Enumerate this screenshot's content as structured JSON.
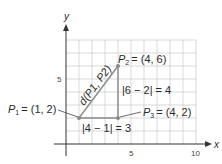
{
  "diagram": {
    "type": "coordinate-plane",
    "colors": {
      "grid": "#c8c8c8",
      "axis": "#333333",
      "segment": "#8a8a8a",
      "point": "#8a8a8a",
      "text": "#2b2b2b"
    },
    "axes": {
      "x_label": "x",
      "y_label": "y",
      "x_ticks": [
        {
          "value": 5,
          "label": "5"
        },
        {
          "value": 10,
          "label": "10"
        }
      ],
      "y_ticks": [
        {
          "value": 5,
          "label": "5"
        }
      ],
      "x_range": [
        0,
        10
      ],
      "y_range": [
        0,
        8
      ]
    },
    "points": [
      {
        "id": "P1",
        "name": "P",
        "sub": "1",
        "x": 1,
        "y": 2,
        "label": "P1 = (1, 2)",
        "coords": "= (1, 2)"
      },
      {
        "id": "P2",
        "name": "P",
        "sub": "2",
        "x": 4,
        "y": 6,
        "label": "P2 = (4, 6)",
        "coords": "= (4, 6)"
      },
      {
        "id": "P3",
        "name": "P",
        "sub": "3",
        "x": 4,
        "y": 2,
        "label": "P3 = (4, 2)",
        "coords": "= (4, 2)"
      }
    ],
    "segments": [
      {
        "from": "P1",
        "to": "P2",
        "label": "d(P1, P2)"
      },
      {
        "from": "P1",
        "to": "P3",
        "label": "|4 − 1| = 3"
      },
      {
        "from": "P3",
        "to": "P2",
        "label": "|6 − 2| = 4"
      }
    ],
    "annotations": {
      "distance": "d(P1, P2)",
      "horizontal": "|4 − 1| = 3",
      "vertical": "|6 − 2| = 4"
    }
  }
}
